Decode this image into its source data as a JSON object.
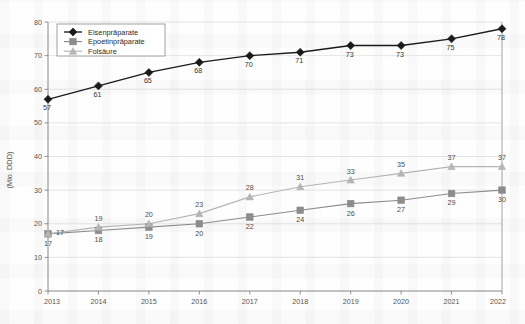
{
  "chart_data": {
    "type": "line",
    "title": "",
    "xlabel": "",
    "ylabel": "(Mio. DDD)",
    "categories": [
      "2013",
      "2014",
      "2015",
      "2016",
      "2017",
      "2018",
      "2019",
      "2020",
      "2021",
      "2022"
    ],
    "ylim": [
      0,
      80
    ],
    "yticks": [
      0,
      10,
      20,
      30,
      40,
      50,
      60,
      70,
      80
    ],
    "grid": "horizontal",
    "legend_position": "top-left",
    "series": [
      {
        "name": "Eisenpräparate",
        "marker": "diamond",
        "color": "#1a1a1a",
        "values": [
          57,
          61,
          65,
          68,
          70,
          71,
          73,
          73,
          75,
          78
        ]
      },
      {
        "name": "Epoetinpräparate",
        "marker": "square",
        "color": "#8c8c8c",
        "values": [
          17,
          18,
          19,
          20,
          22,
          24,
          26,
          27,
          29,
          30
        ]
      },
      {
        "name": "Folsäure",
        "marker": "triangle",
        "color": "#b5b5b5",
        "values": [
          17,
          19,
          20,
          23,
          28,
          31,
          33,
          35,
          37,
          37
        ]
      }
    ]
  },
  "axis": {
    "y_title": "(Mio. DDD)",
    "y_tick_labels": [
      "0",
      "10",
      "20",
      "30",
      "40",
      "50",
      "60",
      "70",
      "80"
    ],
    "x_tick_labels": [
      "2013",
      "2014",
      "2015",
      "2016",
      "2017",
      "2018",
      "2019",
      "2020",
      "2021",
      "2022"
    ]
  },
  "legend": {
    "items": [
      {
        "label": "Eisenpräparate",
        "marker": "diamond-marker",
        "color": "#1a1a1a"
      },
      {
        "label": "Epoetinpräparate",
        "marker": "square-marker",
        "color": "#8c8c8c"
      },
      {
        "label": "Folsäure",
        "marker": "triangle-marker",
        "color": "#b5b5b5"
      }
    ]
  },
  "colors": {
    "eisen": "#1a1a1a",
    "epoetin": "#8c8c8c",
    "folsaeure": "#b5b5b5",
    "grid": "#d8d8d8",
    "axis": "#7a7a7a",
    "background": "#fefefe"
  }
}
